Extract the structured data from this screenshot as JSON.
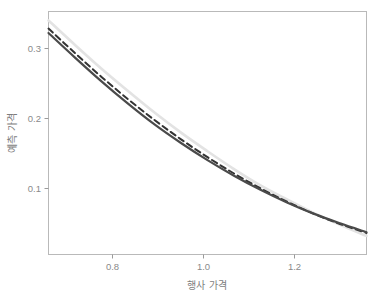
{
  "chart_data": {
    "type": "line",
    "title": "",
    "xlabel": "행사 가격",
    "ylabel": "예측 가격",
    "xlim": [
      0.7,
      1.3
    ],
    "ylim": [
      0.018,
      0.345
    ],
    "xticks": [
      "0.8",
      "1.0",
      "1.2"
    ],
    "xtick_values": [
      0.8,
      1.0,
      1.2
    ],
    "yticks": [
      "0.1",
      "0.2",
      "0.3"
    ],
    "ytick_values": [
      0.1,
      0.2,
      0.3
    ],
    "grid": false,
    "legend": "none",
    "background": "#ffffff",
    "panel_border_color": "#b9b9b9",
    "x": [
      0.7,
      0.75,
      0.8,
      0.85,
      0.9,
      0.95,
      1.0,
      1.05,
      1.1,
      1.15,
      1.2,
      1.25,
      1.3
    ],
    "series": [
      {
        "name": "light-gray-solid",
        "style": "solid",
        "color": "#e3e3e3",
        "width": 2.6,
        "values": [
          0.333,
          0.3,
          0.268,
          0.238,
          0.209,
          0.182,
          0.157,
          0.133,
          0.111,
          0.092,
          0.074,
          0.058,
          0.043
        ]
      },
      {
        "name": "black-dashed",
        "style": "dashed",
        "color": "#333333",
        "width": 2.0,
        "values": [
          0.322,
          0.289,
          0.257,
          0.227,
          0.199,
          0.173,
          0.149,
          0.127,
          0.107,
          0.089,
          0.073,
          0.059,
          0.047
        ]
      },
      {
        "name": "dark-gray-solid",
        "style": "solid",
        "color": "#4a4a4a",
        "width": 2.2,
        "values": [
          0.316,
          0.283,
          0.251,
          0.221,
          0.193,
          0.168,
          0.145,
          0.124,
          0.105,
          0.088,
          0.073,
          0.06,
          0.048
        ]
      }
    ]
  },
  "axis": {
    "x_label": "행사 가격",
    "y_label": "예측 가격",
    "xtick_labels": [
      "0.8",
      "1.0",
      "1.2"
    ],
    "ytick_labels": [
      "0.3",
      "0.2",
      "0.1"
    ]
  }
}
